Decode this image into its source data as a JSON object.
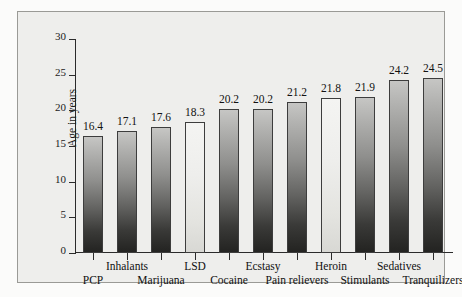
{
  "chart_data": {
    "type": "bar",
    "title": "",
    "xlabel": "",
    "ylabel": "Age in years",
    "ylim": [
      0,
      30
    ],
    "yticks": [
      0,
      5,
      10,
      15,
      20,
      25,
      30
    ],
    "ytick_labels": [
      "0",
      "5",
      "10",
      "15",
      "20",
      "25",
      "30"
    ],
    "grid": false,
    "legend": "none",
    "categories": [
      "PCP",
      "Inhalants",
      "Marijuana",
      "LSD",
      "Cocaine",
      "Ecstasy",
      "Pain relievers",
      "Heroin",
      "Stimulants",
      "Sedatives",
      "Tranquilizers"
    ],
    "values": [
      16.4,
      17.1,
      17.6,
      18.3,
      20.2,
      20.2,
      21.2,
      21.8,
      21.9,
      24.2,
      24.5
    ],
    "value_labels": [
      "16.4",
      "17.1",
      "17.6",
      "18.3",
      "20.2",
      "20.2",
      "21.2",
      "21.8",
      "21.9",
      "24.2",
      "24.5"
    ],
    "bar_styles": [
      "dark",
      "dark",
      "dark",
      "light",
      "dark",
      "dark",
      "dark",
      "light",
      "dark",
      "dark",
      "dark"
    ],
    "label_rows": [
      "bottom",
      "top",
      "bottom",
      "top",
      "bottom",
      "top",
      "bottom",
      "top",
      "bottom",
      "top",
      "bottom"
    ]
  },
  "colors": {
    "page_background": "#fbfbfa",
    "plot_background": "#eeeeec",
    "frame_border": "#9a9a96",
    "axis": "#2b2b2b",
    "text": "#101010",
    "bar_dark_top": "#c6c6c4",
    "bar_dark_bottom": "#232321",
    "bar_light_top": "#f4f4f2",
    "bar_light_bottom": "#d8d8d4",
    "bar_outline": "#3d3d3d"
  }
}
